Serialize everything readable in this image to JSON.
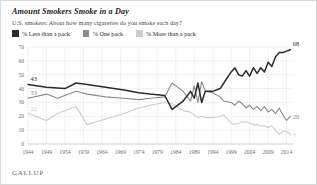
{
  "header": {
    "title": "Amount Smokers Smoke in a Day",
    "subtitle": "U.S. smokers: About how many cigarettes do you smoke each day?"
  },
  "footer": {
    "brand": "GALLUP"
  },
  "legend": {
    "position": "top-left",
    "items": [
      {
        "label": "% Less than a pack",
        "color": "#2b2b2b",
        "key": "less"
      },
      {
        "label": "% One pack",
        "color": "#8a8a8a",
        "key": "one"
      },
      {
        "label": "% More than a pack",
        "color": "#cdcdcd",
        "key": "more"
      }
    ]
  },
  "annotations": {
    "start": [
      {
        "series": "less",
        "value": "43"
      },
      {
        "series": "one",
        "value": "33"
      },
      {
        "series": "more",
        "value": "22"
      }
    ],
    "end": [
      {
        "series": "less",
        "value": "68"
      },
      {
        "series": "one",
        "value": "20"
      },
      {
        "series": "more",
        "value": "7"
      }
    ]
  },
  "chart_data": {
    "type": "line",
    "title": "Amount Smokers Smoke in a Day",
    "subtitle": "U.S. smokers: About how many cigarettes do you smoke each day?",
    "xlabel": "",
    "ylabel": "",
    "xlim": [
      1944,
      2016
    ],
    "ylim": [
      0,
      70
    ],
    "yticks": [
      0,
      10,
      20,
      30,
      40,
      50,
      60,
      70
    ],
    "xticks": [
      1944,
      1949,
      1954,
      1959,
      1964,
      1969,
      1974,
      1979,
      1984,
      1989,
      1994,
      1999,
      2004,
      2009,
      2014
    ],
    "grid": true,
    "legend_position": "top-left",
    "series": [
      {
        "name": "% Less than a pack",
        "key": "less",
        "color": "#2b2b2b",
        "points": [
          [
            1944,
            43
          ],
          [
            1949,
            41
          ],
          [
            1954,
            40
          ],
          [
            1957,
            44
          ],
          [
            1960,
            43
          ],
          [
            1965,
            41
          ],
          [
            1970,
            39
          ],
          [
            1974,
            37
          ],
          [
            1977,
            36
          ],
          [
            1981,
            35
          ],
          [
            1983,
            25
          ],
          [
            1986,
            31
          ],
          [
            1988,
            38
          ],
          [
            1989,
            33
          ],
          [
            1990,
            44
          ],
          [
            1991,
            30
          ],
          [
            1992,
            38
          ],
          [
            1994,
            38
          ],
          [
            1996,
            40
          ],
          [
            1997,
            44
          ],
          [
            1999,
            52
          ],
          [
            2000,
            55
          ],
          [
            2001,
            50
          ],
          [
            2002,
            49
          ],
          [
            2003,
            53
          ],
          [
            2004,
            49
          ],
          [
            2005,
            55
          ],
          [
            2006,
            51
          ],
          [
            2007,
            55
          ],
          [
            2008,
            52
          ],
          [
            2009,
            59
          ],
          [
            2010,
            56
          ],
          [
            2011,
            63
          ],
          [
            2012,
            66
          ],
          [
            2013,
            66
          ],
          [
            2014,
            67
          ],
          [
            2015,
            68
          ]
        ]
      },
      {
        "name": "% One pack",
        "key": "one",
        "color": "#8a8a8a",
        "points": [
          [
            1944,
            33
          ],
          [
            1949,
            36
          ],
          [
            1952,
            33
          ],
          [
            1957,
            38
          ],
          [
            1960,
            36
          ],
          [
            1965,
            34
          ],
          [
            1970,
            33
          ],
          [
            1974,
            32
          ],
          [
            1977,
            33
          ],
          [
            1981,
            34
          ],
          [
            1983,
            44
          ],
          [
            1986,
            38
          ],
          [
            1988,
            31
          ],
          [
            1989,
            42
          ],
          [
            1990,
            30
          ],
          [
            1991,
            45
          ],
          [
            1992,
            38
          ],
          [
            1994,
            37
          ],
          [
            1996,
            34
          ],
          [
            1997,
            31
          ],
          [
            1999,
            30
          ],
          [
            2000,
            28
          ],
          [
            2001,
            31
          ],
          [
            2002,
            29
          ],
          [
            2003,
            26
          ],
          [
            2004,
            28
          ],
          [
            2005,
            25
          ],
          [
            2006,
            27
          ],
          [
            2007,
            24
          ],
          [
            2008,
            27
          ],
          [
            2009,
            23
          ],
          [
            2010,
            25
          ],
          [
            2011,
            22
          ],
          [
            2012,
            26
          ],
          [
            2013,
            21
          ],
          [
            2014,
            17
          ],
          [
            2015,
            20
          ]
        ]
      },
      {
        "name": "% More than a pack",
        "key": "more",
        "color": "#cdcdcd",
        "points": [
          [
            1944,
            22
          ],
          [
            1949,
            17
          ],
          [
            1952,
            22
          ],
          [
            1957,
            27
          ],
          [
            1960,
            14
          ],
          [
            1965,
            18
          ],
          [
            1970,
            22
          ],
          [
            1974,
            26
          ],
          [
            1977,
            28
          ],
          [
            1981,
            30
          ],
          [
            1983,
            29
          ],
          [
            1986,
            24
          ],
          [
            1988,
            23
          ],
          [
            1989,
            21
          ],
          [
            1990,
            19
          ],
          [
            1991,
            20
          ],
          [
            1992,
            19
          ],
          [
            1994,
            19
          ],
          [
            1996,
            20
          ],
          [
            1997,
            21
          ],
          [
            1999,
            15
          ],
          [
            2000,
            14
          ],
          [
            2001,
            15
          ],
          [
            2002,
            16
          ],
          [
            2003,
            16
          ],
          [
            2004,
            15
          ],
          [
            2005,
            14
          ],
          [
            2006,
            14
          ],
          [
            2007,
            13
          ],
          [
            2008,
            13
          ],
          [
            2009,
            12
          ],
          [
            2010,
            13
          ],
          [
            2011,
            10
          ],
          [
            2012,
            7
          ],
          [
            2013,
            9
          ],
          [
            2014,
            9
          ],
          [
            2015,
            7
          ]
        ]
      }
    ]
  }
}
